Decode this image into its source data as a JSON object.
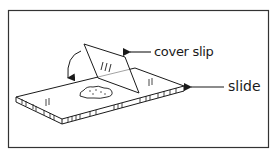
{
  "figure": {
    "cutoff_caption": "",
    "labels": {
      "cover_slip": "cover slip",
      "slide": "slide"
    },
    "colors": {
      "ink": "#1a1a1a",
      "frame": "#333333",
      "background": "#ffffff"
    },
    "parts": [
      {
        "id": "slide",
        "description": "flat glass microscope slide, drawn in perspective"
      },
      {
        "id": "cover-slip",
        "description": "cover slip tilted at an angle, resting on the slide edge"
      },
      {
        "id": "specimen",
        "description": "specimen drop on the slide surface"
      },
      {
        "id": "lowering-arrow",
        "description": "curved arrow indicating the cover slip is lowered onto the slide"
      }
    ]
  }
}
